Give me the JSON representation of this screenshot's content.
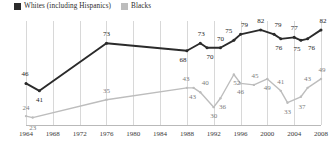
{
  "legend": {
    "position": "top-left",
    "entries": [
      {
        "label": "Whites (including Hispanics)",
        "color": "#2b2b2b",
        "key": "whites"
      },
      {
        "label": "Blacks",
        "color": "#bdbdbd",
        "key": "blacks"
      }
    ]
  },
  "chart_data": {
    "type": "line",
    "title": "",
    "subtitle": "",
    "xlabel": "",
    "ylabel": "",
    "grid": "vertical",
    "xlim": [
      1964,
      2008
    ],
    "ylim": [
      18,
      88
    ],
    "x": [
      1964,
      1968,
      1976,
      1988,
      1990,
      1992,
      1994,
      1996,
      1998,
      2000,
      2002,
      2004,
      2006,
      2008
    ],
    "ticks": [
      "1964",
      "1968",
      "1972",
      "1976",
      "1980",
      "1984",
      "1988",
      "1992",
      "1996",
      "2000",
      "2004",
      "2008"
    ],
    "series": [
      {
        "name": "Whites (including Hispanics)",
        "color": "#2b2b2b",
        "points": [
          {
            "x": 1964,
            "y": 46,
            "label": "46",
            "lx": -1,
            "ly": -9
          },
          {
            "x": 1966,
            "y": 41,
            "label": "41",
            "lx": 0,
            "ly": 9
          },
          {
            "x": 1976,
            "y": 73,
            "label": "73",
            "lx": 0,
            "ly": -9
          },
          {
            "x": 1988,
            "y": 68,
            "label": "68",
            "lx": -4,
            "ly": 9
          },
          {
            "x": 1990,
            "y": 73,
            "label": "73",
            "lx": 1,
            "ly": -9
          },
          {
            "x": 1991,
            "y": 70,
            "label": "70",
            "lx": 3,
            "ly": 9
          },
          {
            "x": 1993,
            "y": 70,
            "label": "70",
            "lx": 0,
            "ly": -9
          },
          {
            "x": 1995,
            "y": 75,
            "label": "75",
            "lx": -5,
            "ly": -9
          },
          {
            "x": 1996,
            "y": 79,
            "label": "79",
            "lx": 4,
            "ly": -9
          },
          {
            "x": 1999,
            "y": 82,
            "label": "82",
            "lx": 0,
            "ly": -9
          },
          {
            "x": 2001,
            "y": 79,
            "label": "79",
            "lx": 4,
            "ly": -9
          },
          {
            "x": 2002,
            "y": 76,
            "label": "76",
            "lx": -2,
            "ly": 9
          },
          {
            "x": 2004,
            "y": 77,
            "label": "77",
            "lx": 0,
            "ly": -9
          },
          {
            "x": 2005,
            "y": 75,
            "label": "75",
            "lx": -4,
            "ly": 9
          },
          {
            "x": 2006,
            "y": 76,
            "label": "76",
            "lx": 4,
            "ly": 9
          },
          {
            "x": 2008,
            "y": 82,
            "label": "82",
            "lx": 2,
            "ly": -9
          }
        ]
      },
      {
        "name": "Blacks",
        "color": "#bdbdbd",
        "points": [
          {
            "x": 1964,
            "y": 24,
            "label": "24",
            "lx": 0,
            "ly": -8
          },
          {
            "x": 1965,
            "y": 23,
            "label": "23",
            "lx": 0,
            "ly": 10
          },
          {
            "x": 1976,
            "y": 35,
            "label": "35",
            "lx": 0,
            "ly": -9
          },
          {
            "x": 1988,
            "y": 43,
            "label": "43",
            "lx": -1,
            "ly": -9
          },
          {
            "x": 1989,
            "y": 43,
            "label": "43",
            "lx": -1,
            "ly": 9
          },
          {
            "x": 1990,
            "y": 40,
            "label": "40",
            "lx": 5,
            "ly": -9
          },
          {
            "x": 1992,
            "y": 30,
            "label": "30",
            "lx": 0,
            "ly": 9
          },
          {
            "x": 1993,
            "y": 36,
            "label": "36",
            "lx": 2,
            "ly": 9
          },
          {
            "x": 1995,
            "y": 52,
            "label": "52",
            "lx": 3,
            "ly": 9
          },
          {
            "x": 1996,
            "y": 46,
            "label": "46",
            "lx": 0,
            "ly": 9
          },
          {
            "x": 1998,
            "y": 45,
            "label": "45",
            "lx": 1,
            "ly": -9
          },
          {
            "x": 2000,
            "y": 49,
            "label": "49",
            "lx": 0,
            "ly": 9
          },
          {
            "x": 2002,
            "y": 41,
            "label": "41",
            "lx": 0,
            "ly": -9
          },
          {
            "x": 2003,
            "y": 33,
            "label": "33",
            "lx": 0,
            "ly": 9
          },
          {
            "x": 2005,
            "y": 37,
            "label": "37",
            "lx": 1,
            "ly": 10
          },
          {
            "x": 2006,
            "y": 43,
            "label": "43",
            "lx": 0,
            "ly": -9
          },
          {
            "x": 2008,
            "y": 49,
            "label": "49",
            "lx": 1,
            "ly": -9
          }
        ]
      }
    ]
  }
}
